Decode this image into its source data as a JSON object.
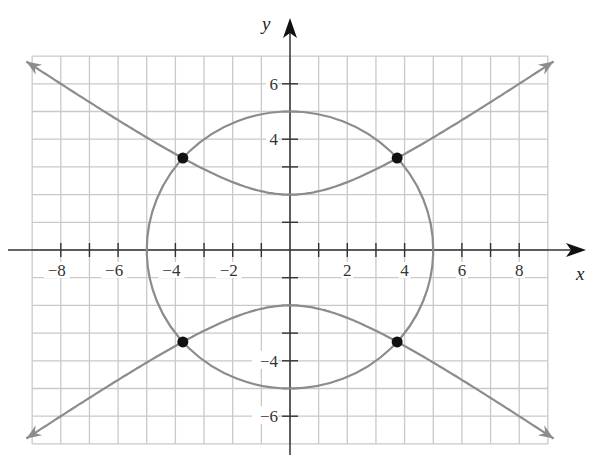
{
  "chart_data": {
    "type": "line",
    "title": "",
    "xlabel": "x",
    "ylabel": "y",
    "xlim": [
      -9,
      9
    ],
    "ylim": [
      -7,
      7
    ],
    "grid": true,
    "grid_step": 1,
    "x_ticks": [
      -8,
      -6,
      -4,
      -2,
      2,
      4,
      6,
      8
    ],
    "y_ticks": [
      -6,
      -4,
      4,
      6
    ],
    "x_tick_labels": [
      "−8",
      "−6",
      "−4",
      "−2",
      "2",
      "4",
      "6",
      "8"
    ],
    "y_tick_labels": [
      "−6",
      "−4",
      "4",
      "6"
    ],
    "series": [
      {
        "name": "circle",
        "equation": "x^2 + y^2 = 25",
        "kind": "circle",
        "center": [
          0,
          0
        ],
        "radius": 5,
        "color": "#8c8c8c"
      },
      {
        "name": "hyperbola",
        "equation": "y^2/4 - x^2/8 = 1",
        "kind": "hyperbola",
        "vertices": [
          [
            0,
            2
          ],
          [
            0,
            -2
          ]
        ],
        "x_range": [
          -9.2,
          9.2
        ],
        "arrows": true,
        "color": "#8c8c8c"
      }
    ],
    "points": [
      {
        "x": -3.74,
        "y": 3.32,
        "label": ""
      },
      {
        "x": 3.74,
        "y": 3.32,
        "label": ""
      },
      {
        "x": -3.74,
        "y": -3.32,
        "label": ""
      },
      {
        "x": 3.74,
        "y": -3.32,
        "label": ""
      }
    ],
    "colors": {
      "grid": "#c9c9c9",
      "axes": "#333333",
      "curves": "#8c8c8c",
      "points": "#111111"
    }
  },
  "labels": {
    "x_axis": "x",
    "y_axis": "y"
  }
}
